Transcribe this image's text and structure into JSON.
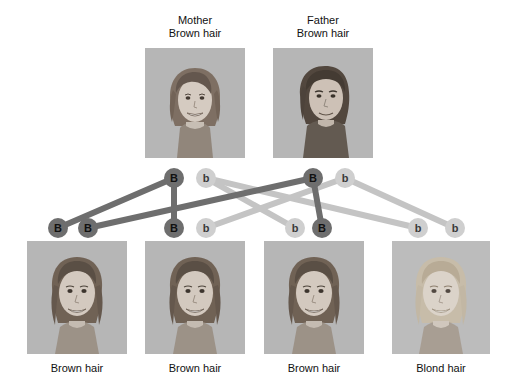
{
  "diagram": {
    "title_hidden": "",
    "type": "punnett-inheritance-pedigree",
    "trait": "hair color",
    "colors": {
      "dominant_allele": "#6e6e6e",
      "recessive_allele": "#cfcfcf",
      "dominant_edge": "#6e6e6e",
      "recessive_edge": "#c4c4c4",
      "photo_background": "#b4b4b4"
    }
  },
  "parents": [
    {
      "role": "Mother",
      "phenotype": "Brown hair",
      "label": "Mother\nBrown hair",
      "alleles": [
        {
          "symbol": "B",
          "kind": "dominant"
        },
        {
          "symbol": "b",
          "kind": "recessive"
        }
      ]
    },
    {
      "role": "Father",
      "phenotype": "Brown hair",
      "label": "Father\nBrown hair",
      "alleles": [
        {
          "symbol": "B",
          "kind": "dominant"
        },
        {
          "symbol": "b",
          "kind": "recessive"
        }
      ]
    }
  ],
  "children": [
    {
      "phenotype": "Brown hair",
      "genotype": "BB",
      "alleles": [
        {
          "symbol": "B",
          "kind": "dominant"
        },
        {
          "symbol": "B",
          "kind": "dominant"
        }
      ]
    },
    {
      "phenotype": "Brown hair",
      "genotype": "Bb",
      "alleles": [
        {
          "symbol": "B",
          "kind": "dominant"
        },
        {
          "symbol": "b",
          "kind": "recessive"
        }
      ]
    },
    {
      "phenotype": "Brown hair",
      "genotype": "bB",
      "alleles": [
        {
          "symbol": "b",
          "kind": "recessive"
        },
        {
          "symbol": "B",
          "kind": "dominant"
        }
      ]
    },
    {
      "phenotype": "Blond hair",
      "genotype": "bb",
      "alleles": [
        {
          "symbol": "b",
          "kind": "recessive"
        },
        {
          "symbol": "b",
          "kind": "recessive"
        }
      ]
    }
  ]
}
